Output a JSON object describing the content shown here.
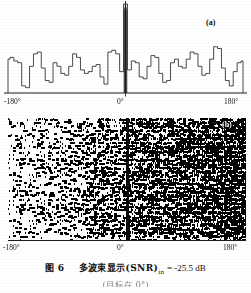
{
  "figure": {
    "caption_number": "图 6",
    "caption_text": "多波束显示(SNR)",
    "caption_subscript": "in",
    "caption_value": "= -25.5 dB",
    "caption_line2": "(目标在 0°)",
    "panel_a_label": "(a)",
    "panel_b_label": "(b)"
  },
  "axis_a": {
    "left_tick": "-180°",
    "center_tick": "0°",
    "right_tick": "180°"
  },
  "axis_b": {
    "left_tick": "-180°",
    "center_tick": "0°",
    "right_tick": "180°"
  },
  "chart_data": {
    "type": "line",
    "xlabel": "方位角 (bearing angle)",
    "ylabel": "波束输出幅度 (beam output amplitude)",
    "xlim": [
      -180,
      180
    ],
    "ylim": [
      0,
      100
    ],
    "grid": false,
    "legend": null,
    "annotations": [
      {
        "text": "(a)",
        "x": 150,
        "y": 92,
        "note": "panel a identifier"
      },
      {
        "text": "(b)",
        "x": 172,
        "y": 0,
        "note": "panel b identifier, overlays noise field"
      },
      {
        "text": "target at 0°",
        "x": 0,
        "y": 100,
        "note": "tall spike marks detected target bearing"
      }
    ],
    "panels": [
      {
        "name": "panel_a_beam_pattern",
        "type": "line",
        "style": "step",
        "xlabel_ticks": [
          "-180°",
          "0°",
          "180°"
        ],
        "x": [
          -180,
          -174,
          -168,
          -162,
          -156,
          -150,
          -144,
          -138,
          -132,
          -126,
          -120,
          -114,
          -108,
          -102,
          -96,
          -90,
          -84,
          -78,
          -72,
          -66,
          -60,
          -54,
          -48,
          -42,
          -36,
          -30,
          -24,
          -18,
          -12,
          -6,
          0,
          6,
          12,
          18,
          24,
          30,
          36,
          42,
          48,
          54,
          60,
          66,
          72,
          78,
          84,
          90,
          96,
          102,
          108,
          114,
          120,
          126,
          132,
          138,
          144,
          150,
          156,
          162,
          168,
          174,
          180
        ],
        "values": [
          38,
          40,
          36,
          34,
          8,
          6,
          30,
          44,
          46,
          28,
          14,
          12,
          34,
          30,
          22,
          20,
          30,
          44,
          40,
          26,
          22,
          24,
          30,
          32,
          18,
          10,
          46,
          48,
          44,
          24,
          100,
          26,
          36,
          34,
          18,
          16,
          30,
          42,
          40,
          22,
          12,
          14,
          34,
          38,
          30,
          28,
          38,
          46,
          44,
          30,
          20,
          22,
          38,
          52,
          50,
          28,
          14,
          8,
          24,
          34,
          36
        ],
        "peak": {
          "x": 0,
          "y": 100,
          "label": "target spike at 0°"
        }
      },
      {
        "name": "panel_b_waterfall",
        "type": "heatmap",
        "description": "speckled black/white noise waterfall, density increasing from left to right, vertical dark target track at 0°",
        "xlabel_ticks": [
          "-180°",
          "0°",
          "180°"
        ],
        "rows": 92,
        "cols": 180,
        "density_left": 0.08,
        "density_right": 0.62,
        "target_column_x": 0,
        "target_column_density": 0.97
      }
    ]
  }
}
